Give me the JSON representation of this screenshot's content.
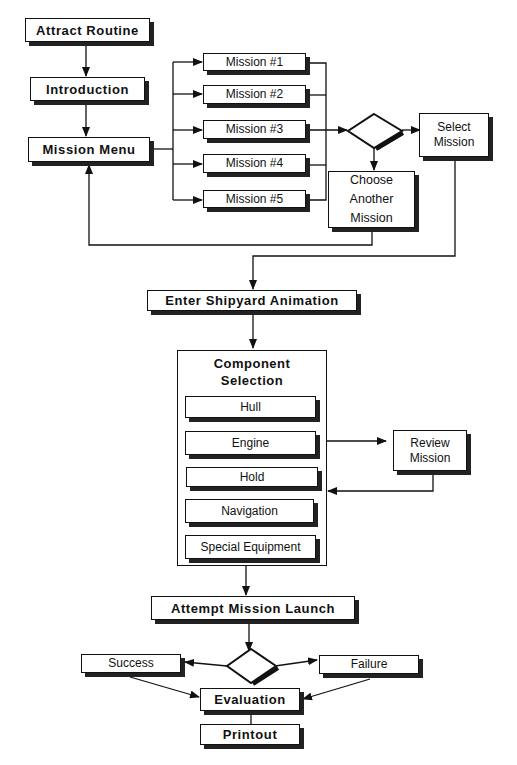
{
  "nodes": {
    "attract": "Attract Routine",
    "intro": "Introduction",
    "menu": "Mission Menu",
    "missions": [
      "Mission #1",
      "Mission #2",
      "Mission #3",
      "Mission #4",
      "Mission #5"
    ],
    "select": "Select Mission",
    "choose": "Choose Another Mission",
    "shipyard": "Enter Shipyard Animation",
    "component_title": "Component Selection",
    "components": [
      "Hull",
      "Engine",
      "Hold",
      "Navigation",
      "Special Equipment"
    ],
    "review": "Review Mission",
    "launch": "Attempt Mission Launch",
    "success": "Success",
    "failure": "Failure",
    "evaluation": "Evaluation",
    "printout": "Printout"
  }
}
